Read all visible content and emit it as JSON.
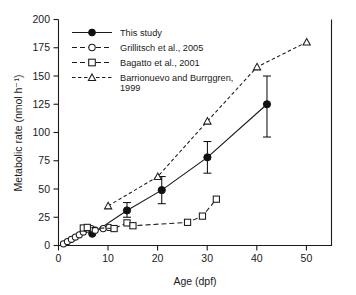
{
  "chart_data": {
    "type": "line",
    "title": "",
    "xlabel": "Age (dpf)",
    "ylabel": "Metabolic rate (nmol h⁻¹)",
    "xlim": [
      0,
      55
    ],
    "ylim": [
      0,
      200
    ],
    "xticks": [
      0,
      10,
      20,
      30,
      40,
      50
    ],
    "yticks": [
      0,
      25,
      50,
      75,
      100,
      125,
      150,
      175,
      200
    ],
    "grid": false,
    "legend_position": "top-left",
    "series": [
      {
        "name": "This study",
        "marker": "filled-circle",
        "line": "solid",
        "x": [
          6.8,
          13.8,
          20.8,
          30.0,
          42.0
        ],
        "y": [
          10.5,
          31.0,
          49.0,
          78.0,
          125.0
        ],
        "yerr_low": [
          10.5,
          25.0,
          37.0,
          64.0,
          96.0
        ],
        "yerr_high": [
          10.5,
          38.0,
          61.0,
          92.0,
          150.0
        ]
      },
      {
        "name": "Grillitsch et al., 2005",
        "marker": "open-circle",
        "line": "dashed",
        "x": [
          1.0,
          1.8,
          2.6,
          3.4,
          4.2,
          5.0,
          5.8,
          6.6,
          7.4,
          9.0,
          10.2
        ],
        "y": [
          1.5,
          3.5,
          5.5,
          7.5,
          9.5,
          12.0,
          14.5,
          15.0,
          13.5,
          15.0,
          16.0
        ]
      },
      {
        "name": "Bagatto et al., 2001",
        "marker": "open-square",
        "line": "dashed",
        "x": [
          5.0,
          5.8,
          11.2,
          13.8,
          15.0,
          26.0,
          29.0,
          31.8
        ],
        "y": [
          15.5,
          16.0,
          15.0,
          20.0,
          17.5,
          20.5,
          26.0,
          41.0
        ]
      },
      {
        "name": "Barrionuevo and Burrggren, 1999",
        "marker": "open-triangle",
        "line": "dashed",
        "x": [
          10.0,
          20.0,
          30.0,
          40.0,
          50.0
        ],
        "y": [
          35.0,
          61.0,
          110.0,
          158.0,
          180.0
        ]
      }
    ]
  },
  "legend": {
    "entries": [
      {
        "label": "This study"
      },
      {
        "label": "Grillitsch et al., 2005"
      },
      {
        "label": "Bagatto et al., 2001"
      },
      {
        "label": "Barrionuevo and Burrggren,"
      },
      {
        "label": "1999"
      }
    ]
  },
  "axes": {
    "y_title": "Metabolic rate (nmol h⁻¹)",
    "x_title": "Age (dpf)",
    "y_tick_labels": [
      "0",
      "25",
      "50",
      "75",
      "100",
      "125",
      "150",
      "175",
      "200"
    ],
    "x_tick_labels": [
      "0",
      "10",
      "20",
      "30",
      "40",
      "50"
    ]
  }
}
